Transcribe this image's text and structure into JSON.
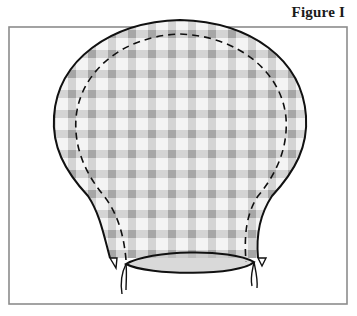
{
  "figure": {
    "caption": "Figure I",
    "colors": {
      "frame": "#8c8c8c",
      "outline": "#111111",
      "gingham_light": "#d4d4d4",
      "gingham_dark": "#a8a8a8",
      "fabric_base": "#eeeeee"
    },
    "elements": {
      "fabric_piece": "gingham fabric cut in rounded balloon/bonnet shape",
      "seam_line": "dashed stitching line inside outer edge",
      "gathered_opening": "elliptical drawstring opening at bottom",
      "ties": "drawstring ties at left and right of opening"
    }
  }
}
